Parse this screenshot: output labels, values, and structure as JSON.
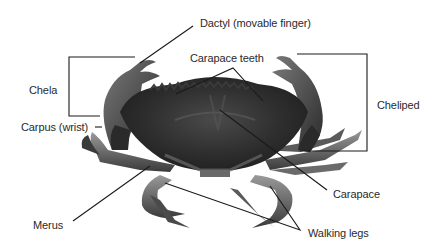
{
  "diagram": {
    "labels": {
      "dactyl": "Dactyl (movable finger)",
      "chela": "Chela",
      "carpus": "Carpus (wrist)",
      "carapace_teeth": "Carapace teeth",
      "cheliped": "Cheliped",
      "carapace": "Carapace",
      "merus": "Merus",
      "walking_legs": "Walking legs"
    },
    "colors": {
      "line": "#1a1a1a",
      "text": "#2a2a2a",
      "crab_dark": "#2b2b2b",
      "crab_mid": "#555555",
      "crab_light": "#8a8a8a",
      "background": "#ffffff"
    }
  }
}
